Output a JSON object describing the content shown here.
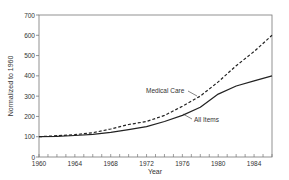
{
  "chart_data": {
    "type": "line",
    "title": "",
    "xlabel": "Year",
    "ylabel": "Normalized to 1960",
    "xlim": [
      1960,
      1986
    ],
    "ylim": [
      0,
      700
    ],
    "x_ticks": [
      1960,
      1964,
      1968,
      1972,
      1976,
      1980,
      1984
    ],
    "y_ticks": [
      0,
      100,
      200,
      300,
      400,
      500,
      600,
      700
    ],
    "grid": false,
    "legend": "inline labels",
    "x": [
      1960,
      1962,
      1964,
      1966,
      1968,
      1970,
      1972,
      1974,
      1976,
      1978,
      1980,
      1982,
      1984,
      1986
    ],
    "series": [
      {
        "name": "Medical Care",
        "style": "dashed",
        "values": [
          100,
          105,
          110,
          120,
          138,
          160,
          175,
          205,
          250,
          300,
          370,
          450,
          520,
          600
        ]
      },
      {
        "name": "All Items",
        "style": "solid",
        "values": [
          100,
          102,
          106,
          112,
          122,
          135,
          150,
          175,
          205,
          245,
          310,
          350,
          375,
          400
        ]
      }
    ],
    "annotations": [
      {
        "text": "Medical Care",
        "x": 1975,
        "y": 300
      },
      {
        "text": "All Items",
        "x": 1978,
        "y": 215
      }
    ]
  }
}
